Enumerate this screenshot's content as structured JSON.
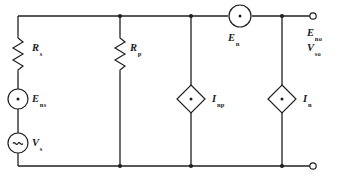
{
  "diagram": {
    "labels": {
      "r_s": "R",
      "r_s_sub": "s",
      "r_p": "R",
      "r_p_sub": "p",
      "e_ns": "E",
      "e_ns_sub": "ns",
      "v_s": "V",
      "v_s_sub": "s",
      "e_n": "E",
      "e_n_sub": "n",
      "i_np": "I",
      "i_np_sub": "np",
      "i_n": "I",
      "i_n_sub": "n",
      "e_no": "E",
      "e_no_sub": "no",
      "v_so": "V",
      "v_so_sub": "so"
    },
    "components": [
      {
        "name": "resistor-rs",
        "kind": "resistor",
        "label": "R s"
      },
      {
        "name": "resistor-rp",
        "kind": "resistor",
        "label": "R p"
      },
      {
        "name": "source-ens",
        "kind": "voltage-source-dot",
        "label": "E ns"
      },
      {
        "name": "source-vs",
        "kind": "ac-voltage-source",
        "label": "V s"
      },
      {
        "name": "source-en",
        "kind": "voltage-source-dot",
        "label": "E n"
      },
      {
        "name": "source-inp",
        "kind": "current-source-diamond",
        "label": "I np"
      },
      {
        "name": "source-in",
        "kind": "current-source-diamond",
        "label": "I n"
      }
    ],
    "terminals": [
      "output-terminal-top",
      "output-terminal-bottom"
    ],
    "colors": {
      "line": "#1f1f1f",
      "background": "#ffffff"
    }
  }
}
